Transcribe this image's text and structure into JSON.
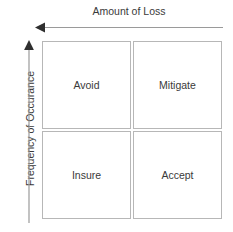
{
  "diagram": {
    "type": "risk-management-matrix",
    "x_axis": {
      "label": "Amount of Loss",
      "arrow_direction": "left",
      "icon": "arrow-left-icon"
    },
    "y_axis": {
      "label": "Frequency of Occurance",
      "arrow_direction": "up",
      "icon": "arrow-up-icon"
    },
    "quadrants": [
      {
        "label": "Avoid",
        "position": "top-left"
      },
      {
        "label": "Mitigate",
        "position": "top-right"
      },
      {
        "label": "Insure",
        "position": "bottom-left"
      },
      {
        "label": "Accept",
        "position": "bottom-right"
      }
    ],
    "colors": {
      "background": "#ffffff",
      "border": "#b7b7b7",
      "text": "#3a3a3a",
      "axis_line": "#9a9a9a"
    }
  }
}
